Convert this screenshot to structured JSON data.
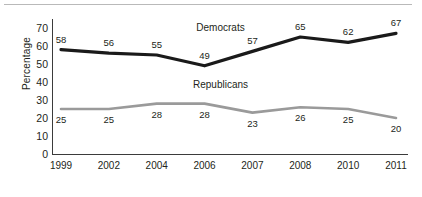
{
  "chart_data": {
    "type": "line",
    "title": "",
    "xlabel": "",
    "ylabel": "Percentage",
    "categories": [
      "1999",
      "2002",
      "2004",
      "2006",
      "2007",
      "2008",
      "2010",
      "2011"
    ],
    "yticks": [
      0,
      10,
      20,
      30,
      40,
      50,
      60,
      70
    ],
    "ylim": [
      0,
      75
    ],
    "grid": false,
    "legend": "inline-series-labels",
    "series": [
      {
        "name": "Democrats",
        "color": "#1a1a1a",
        "label_position": "above",
        "values": [
          58,
          56,
          55,
          49,
          57,
          65,
          62,
          67
        ]
      },
      {
        "name": "Republicans",
        "color": "#9a9a9a",
        "label_position": "below",
        "values": [
          25,
          25,
          28,
          28,
          23,
          26,
          25,
          20
        ]
      }
    ]
  },
  "figure": {
    "background_color": "#ffffff",
    "axis_color": "#3b3b3b",
    "rule_color": "#b9b9b9",
    "text_color": "#231f20"
  }
}
